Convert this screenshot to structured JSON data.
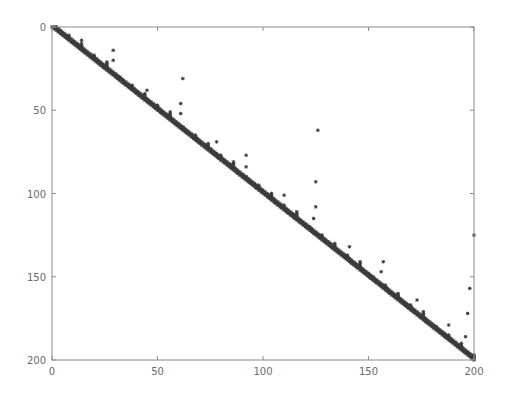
{
  "chart_data": {
    "type": "scatter",
    "subtype": "sparsity-pattern (spy plot)",
    "title": "",
    "xlabel": "",
    "ylabel": "",
    "xlim": [
      0,
      200
    ],
    "ylim": [
      200,
      0
    ],
    "y_axis_inverted": true,
    "grid": false,
    "legend": null,
    "x_ticks": [
      0,
      50,
      100,
      150,
      200
    ],
    "y_ticks": [
      0,
      50,
      100,
      150,
      200
    ],
    "marker": "*",
    "marker_color": "#3a3a3a",
    "matrix_size": 200,
    "bands": [
      {
        "name": "main-diagonal",
        "offset": 0
      },
      {
        "name": "super-diagonal-1",
        "offset": 1
      },
      {
        "name": "super-diagonal-2",
        "offset": 2
      }
    ],
    "periodic_spikes": {
      "period": 6,
      "start": 2,
      "heights": [
        2,
        3,
        4,
        3,
        5
      ]
    },
    "isolated_points": [
      {
        "col": 14,
        "row": 8
      },
      {
        "col": 29,
        "row": 14
      },
      {
        "col": 29,
        "row": 20
      },
      {
        "col": 45,
        "row": 38
      },
      {
        "col": 62,
        "row": 31
      },
      {
        "col": 61,
        "row": 46
      },
      {
        "col": 61,
        "row": 52
      },
      {
        "col": 78,
        "row": 69
      },
      {
        "col": 92,
        "row": 77
      },
      {
        "col": 92,
        "row": 84
      },
      {
        "col": 110,
        "row": 101
      },
      {
        "col": 126,
        "row": 62
      },
      {
        "col": 125,
        "row": 93
      },
      {
        "col": 125,
        "row": 108
      },
      {
        "col": 124,
        "row": 115
      },
      {
        "col": 141,
        "row": 132
      },
      {
        "col": 157,
        "row": 141
      },
      {
        "col": 156,
        "row": 147
      },
      {
        "col": 173,
        "row": 164
      },
      {
        "col": 188,
        "row": 179
      },
      {
        "col": 200,
        "row": 125
      },
      {
        "col": 198,
        "row": 157
      },
      {
        "col": 197,
        "row": 172
      },
      {
        "col": 196,
        "row": 186
      }
    ]
  },
  "axes": {
    "frame_color": "#8a8a8a",
    "label_color": "#6a6a6a",
    "x_tick_labels": [
      "0",
      "50",
      "100",
      "150",
      "200"
    ],
    "y_tick_labels": [
      "0",
      "50",
      "100",
      "150",
      "200"
    ]
  }
}
